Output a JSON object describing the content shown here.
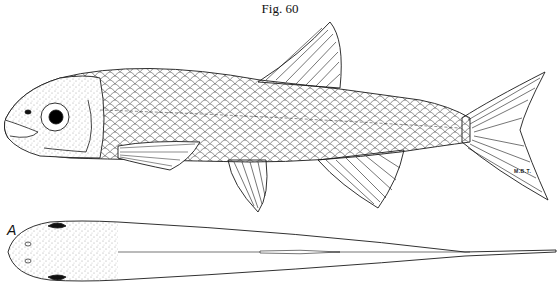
{
  "figure": {
    "title": "Fig. 60",
    "panel_label": "A",
    "signature": "M.B.T.",
    "views": [
      {
        "name": "lateral-view",
        "description": "Left lateral view of minnow-like fish with scales, dorsal, pectoral, pelvic, anal and forked caudal fins"
      },
      {
        "name": "dorsal-view",
        "description": "Dorsal view of fish head and body, labeled A"
      }
    ]
  },
  "colors": {
    "ink": "#1a1a1a",
    "background": "#ffffff"
  }
}
